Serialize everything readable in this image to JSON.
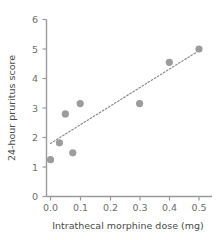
{
  "chart_data": {
    "type": "scatter",
    "title": "",
    "xlabel": "Intrathecal morphine dose (mg)",
    "ylabel": "24-hour pruritus score",
    "xlim": [
      -0.03,
      0.545
    ],
    "ylim": [
      0,
      6
    ],
    "xticks": [
      0.0,
      0.1,
      0.2,
      0.3,
      0.4,
      0.5
    ],
    "xticklabels": [
      "0.0",
      "0.1",
      "0.2",
      "0.3",
      "0.4",
      "0.5"
    ],
    "yticks": [
      0,
      1,
      2,
      3,
      4,
      5,
      6
    ],
    "yticklabels": [
      "0",
      "1",
      "2",
      "3",
      "4",
      "5",
      "6"
    ],
    "grid": false,
    "legend": false,
    "marker_color": "#9c9c9c",
    "marker_shape": "circle",
    "points": [
      {
        "x": 0.0,
        "y": 1.25
      },
      {
        "x": 0.03,
        "y": 1.82
      },
      {
        "x": 0.05,
        "y": 2.8
      },
      {
        "x": 0.075,
        "y": 1.48
      },
      {
        "x": 0.1,
        "y": 3.15
      },
      {
        "x": 0.3,
        "y": 3.15
      },
      {
        "x": 0.4,
        "y": 4.55
      },
      {
        "x": 0.5,
        "y": 5.0
      }
    ],
    "trendline": {
      "style": "dotted",
      "color": "#8c8c8c",
      "x0": 0.0,
      "y0": 1.8,
      "x1": 0.512,
      "y1": 5.02
    }
  },
  "axes": {
    "x_title": "Intrathecal morphine dose (mg)",
    "y_title": "24-hour pruritus score",
    "x_tick_labels": [
      "0.0",
      "0.1",
      "0.2",
      "0.3",
      "0.4",
      "0.5"
    ],
    "y_tick_labels": [
      "0",
      "1",
      "2",
      "3",
      "4",
      "5",
      "6"
    ]
  }
}
